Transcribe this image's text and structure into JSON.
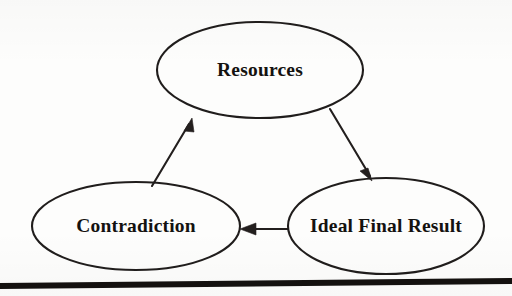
{
  "diagram": {
    "type": "cycle-diagram",
    "background_color": "#fdfdfc",
    "stroke_color": "#231f1e",
    "text_color": "#141210",
    "nodes": [
      {
        "id": "resources",
        "label": "Resources",
        "shape": "ellipse",
        "cx": 260,
        "cy": 70,
        "rx": 103,
        "ry": 48
      },
      {
        "id": "ideal-final-result",
        "label": "Ideal Final Result",
        "shape": "ellipse",
        "cx": 386,
        "cy": 226,
        "rx": 98,
        "ry": 48
      },
      {
        "id": "contradiction",
        "label": "Contradiction",
        "shape": "ellipse",
        "cx": 136,
        "cy": 226,
        "rx": 104,
        "ry": 44
      }
    ],
    "edges": [
      {
        "id": "resources-to-ideal-final-result",
        "from": "resources",
        "to": "ideal-final-result",
        "arrow": "single",
        "direction": "down-right"
      },
      {
        "id": "ideal-final-result-to-contradiction",
        "from": "ideal-final-result",
        "to": "contradiction",
        "arrow": "single",
        "direction": "left"
      },
      {
        "id": "contradiction-to-resources",
        "from": "contradiction",
        "to": "resources",
        "arrow": "single",
        "direction": "up-right"
      }
    ],
    "footer_rule": {
      "visible": true,
      "color": "#14110f"
    }
  }
}
